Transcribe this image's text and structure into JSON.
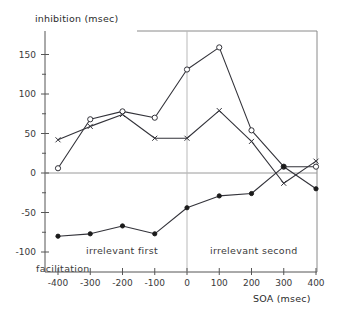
{
  "chart_data": {
    "type": "line",
    "title": "",
    "xlabel": "SOA (msec)",
    "ylabel": "inhibition (msec)",
    "x": [
      -400,
      -300,
      -200,
      -100,
      0,
      100,
      200,
      300,
      400
    ],
    "xlim": [
      -450,
      450
    ],
    "ylim": [
      -112,
      175
    ],
    "grid": false,
    "legend": "none",
    "xticklabels": [
      "-400",
      "-300",
      "-200",
      "-100",
      "0",
      "100",
      "200",
      "300",
      "400"
    ],
    "yticklabels": [
      "150",
      "100",
      "50",
      "0",
      "-50",
      "-100"
    ],
    "yticks": [
      150,
      100,
      50,
      0,
      -50,
      -100
    ],
    "yminortick_step": 25,
    "series": [
      {
        "name": "open-circle",
        "marker": "circle-open",
        "values": [
          6,
          68,
          78,
          70,
          131,
          159,
          54,
          8,
          8
        ]
      },
      {
        "name": "x-marker",
        "marker": "x",
        "values": [
          42,
          59,
          74,
          44,
          44,
          79,
          40,
          -13,
          15
        ]
      },
      {
        "name": "filled-circle",
        "marker": "circle-filled",
        "values": [
          -80,
          -77,
          -67,
          -77,
          -44,
          -29,
          -26,
          8,
          -20
        ]
      }
    ],
    "annotations": [
      {
        "text": "irrelevant first",
        "x": -200
      },
      {
        "text": "irrelevant second",
        "x": 200
      },
      {
        "text": "facilitation",
        "x": -400
      }
    ],
    "reference_lines": [
      {
        "name": "zero-line",
        "orientation": "horizontal",
        "value": 0
      },
      {
        "name": "soa-zero-divider",
        "orientation": "vertical",
        "value": 0
      }
    ]
  },
  "axes": {
    "y_label_text": "inhibition (msec)",
    "x_label_text": "SOA (msec)",
    "y_ticks": [
      {
        "label": "150"
      },
      {
        "label": "100"
      },
      {
        "label": "50"
      },
      {
        "label": "0"
      },
      {
        "label": "-50"
      },
      {
        "label": "-100"
      }
    ],
    "x_ticks": [
      {
        "label": "-400"
      },
      {
        "label": "-300"
      },
      {
        "label": "-200"
      },
      {
        "label": "-100"
      },
      {
        "label": "0"
      },
      {
        "label": "100"
      },
      {
        "label": "200"
      },
      {
        "label": "300"
      },
      {
        "label": "400"
      }
    ]
  },
  "annotations": {
    "irrelevant_first": "irrelevant first",
    "irrelevant_second": "irrelevant second",
    "facilitation": "facilitation"
  },
  "colors": {
    "background": "#ffffff",
    "ink": "#33333a",
    "axis": "#555555",
    "zero_line": "#9a9a9a",
    "divider": "#b9b9b9"
  }
}
